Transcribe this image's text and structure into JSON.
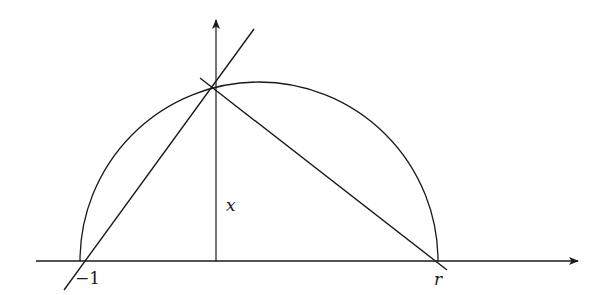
{
  "diagram": {
    "type": "geometric-construction",
    "colors": {
      "stroke": "#1a1a1a",
      "background": "#ffffff"
    },
    "labels": {
      "left_point": "−1",
      "right_point": "r",
      "height": "x"
    },
    "elements": [
      {
        "id": "horizontal-axis",
        "kind": "arrow",
        "from": [
          36,
          261
        ],
        "to": [
          580,
          261
        ]
      },
      {
        "id": "vertical-axis",
        "kind": "arrow",
        "from": [
          216,
          261
        ],
        "to": [
          216,
          18
        ]
      },
      {
        "id": "semicircle",
        "kind": "arc",
        "center": [
          259,
          261
        ],
        "radius": 179
      },
      {
        "id": "chord-left",
        "kind": "line",
        "from": [
          64,
          290
        ],
        "to": [
          254,
          29
        ]
      },
      {
        "id": "chord-right",
        "kind": "line",
        "from": [
          200,
          78
        ],
        "to": [
          447,
          270
        ]
      }
    ],
    "points": {
      "minus_one": [
        80,
        261
      ],
      "r": [
        438,
        261
      ],
      "origin": [
        216,
        261
      ],
      "apex": [
        216,
        90
      ]
    }
  }
}
